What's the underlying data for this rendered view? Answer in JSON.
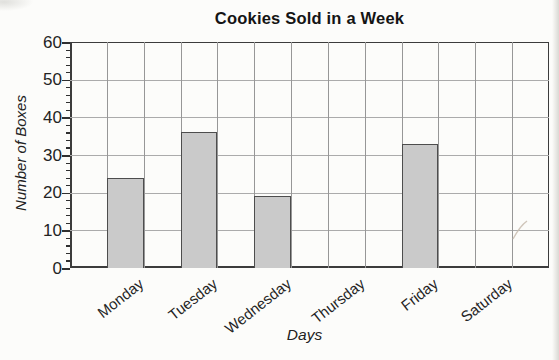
{
  "chart_data": {
    "type": "bar",
    "title": "Cookies Sold in a Week",
    "xlabel": "Days",
    "ylabel": "Number of Boxes",
    "categories": [
      "Monday",
      "Tuesday",
      "Wednesday",
      "Thursday",
      "Friday",
      "Saturday"
    ],
    "values": [
      24,
      36,
      19,
      0,
      33,
      0
    ],
    "ylim": [
      0,
      60
    ],
    "ytick_step": 10,
    "yticks": [
      "0",
      "10",
      "20",
      "30",
      "40",
      "50",
      "60"
    ],
    "minor_tick_step": 2,
    "grid": "on",
    "grid_columns_per_category": 2,
    "legend": "none",
    "bar_fill": "#cacaca",
    "bar_border": "#4d4d4d",
    "grid_color_h": "#ababab",
    "grid_color_v": "#979797",
    "axis_color": "#3c3c3c"
  }
}
